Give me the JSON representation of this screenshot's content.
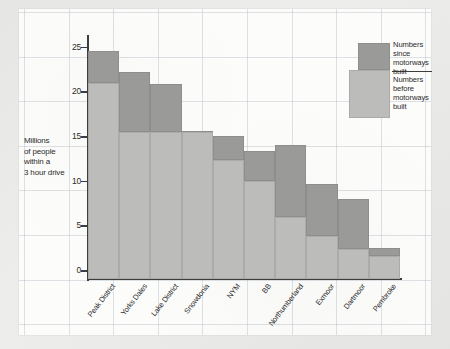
{
  "chart_data": {
    "type": "bar",
    "stacked": true,
    "title": "",
    "xlabel": "",
    "ylabel": "Millions of people within a 3 hour drive",
    "ylim": [
      0,
      27
    ],
    "yticks": [
      0,
      5,
      10,
      15,
      20,
      25
    ],
    "ytick_labels": [
      "0",
      "5",
      "10",
      "15",
      "20",
      "25"
    ],
    "grid": true,
    "legend_position": "top-right",
    "categories": [
      "Peak District",
      "Yorks Dales",
      "Lake District",
      "Snowdonia",
      "NYM",
      "BB",
      "Northumberland",
      "Exmoor",
      "Dartmoor",
      "Pembroke"
    ],
    "series": [
      {
        "name": "Numbers before motorways built",
        "color": "#bcbcba",
        "values": [
          22.0,
          16.5,
          16.5,
          16.5,
          13.3,
          11.0,
          7.0,
          4.8,
          3.4,
          2.6
        ]
      },
      {
        "name": "Numbers since motorways built",
        "color": "#9a9a98",
        "values": [
          25.5,
          23.2,
          21.8,
          16.6,
          16.0,
          14.3,
          15.0,
          10.7,
          9.0,
          3.5
        ]
      }
    ]
  },
  "axis": {
    "y_title_lines": [
      "Millions",
      "of people",
      "within a",
      "3 hour drive"
    ]
  },
  "legend": {
    "since_label": "Numbers since motorways built",
    "since_lines": [
      "Numbers",
      "since",
      "motorways",
      "built"
    ],
    "before_label": "Numbers before motorways built",
    "before_lines": [
      "Numbers",
      "before",
      "motorways",
      "built"
    ],
    "since_color": "#9a9a98",
    "before_color": "#bcbcba"
  },
  "colors": {
    "paper": "#fcfcfb",
    "page_background": "#e9e9e7",
    "axis": "#3d3d3d",
    "grid": "#96a0af",
    "text": "#2b2b2b"
  }
}
